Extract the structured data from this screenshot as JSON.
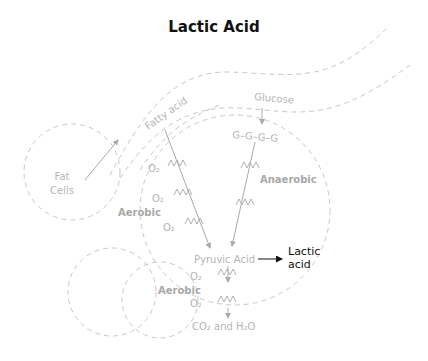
{
  "title": "Lactic Acid",
  "labels": {
    "fat_cells_line1": "Fat",
    "fat_cells_line2": "Cells",
    "fatty_acid": "Fatty acid",
    "glucose": "Glucose",
    "glucose_chain": "G–G–G–G",
    "anaerobic": "Anaerobic",
    "aerobic_upper": "Aerobic",
    "aerobic_lower": "Aerobic",
    "pyruvic_acid": "Pyruvic Acid",
    "lactic_line1": "Lactic",
    "lactic_line2": "acid",
    "co2_h2o": "CO₂ and H₂O",
    "o2": "O₂"
  },
  "colors": {
    "title": "#111111",
    "faint_text": "#b5b5b5",
    "dashed_line": "#c8c8c8",
    "lactic_text": "#111111"
  }
}
